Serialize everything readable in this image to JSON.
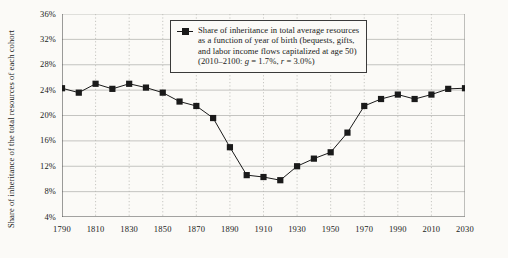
{
  "chart_data": {
    "type": "line",
    "title": "",
    "xlabel": "",
    "ylabel": "Share of inheritance of the total resources of each cohort",
    "xlim": [
      1790,
      2030
    ],
    "ylim": [
      4,
      36
    ],
    "ytick_labels": [
      "36%",
      "32%",
      "28%",
      "24%",
      "20%",
      "16%",
      "12%",
      "8%",
      "4%"
    ],
    "ytick_values": [
      36,
      32,
      28,
      24,
      20,
      16,
      12,
      8,
      4
    ],
    "xtick_labels": [
      "1790",
      "1810",
      "1830",
      "1850",
      "1870",
      "1890",
      "1910",
      "1930",
      "1950",
      "1970",
      "1990",
      "2010",
      "2030"
    ],
    "xtick_values": [
      1790,
      1810,
      1830,
      1850,
      1870,
      1890,
      1910,
      1930,
      1950,
      1970,
      1990,
      2010,
      2030
    ],
    "grid": "horizontal-solid-and-vertical-dotted",
    "legend_position": "top-center",
    "series": [
      {
        "name": "Share of inheritance in total average resources as a function of year of birth",
        "marker": "filled-square",
        "color": "#1a1a1a",
        "x": [
          1790,
          1800,
          1810,
          1820,
          1830,
          1840,
          1850,
          1860,
          1870,
          1880,
          1890,
          1900,
          1910,
          1920,
          1930,
          1940,
          1950,
          1960,
          1970,
          1980,
          1990,
          2000,
          2010,
          2020,
          2030
        ],
        "values": [
          24.3,
          23.6,
          25.0,
          24.2,
          25.0,
          24.4,
          23.6,
          22.2,
          21.5,
          19.6,
          15.0,
          10.6,
          10.3,
          9.8,
          12.0,
          13.2,
          14.2,
          17.3,
          21.5,
          22.6,
          23.3,
          22.6,
          23.3,
          24.2,
          24.3
        ]
      }
    ],
    "legend": {
      "line1": "Share of inheritance in total average resources",
      "line2": "as a function of year of birth (bequests, gifts,",
      "line3": "and labor income flows capitalized at age 50)",
      "line4_prefix": "(2010–2100: ",
      "line4_g": "g",
      "line4_mid": " = 1.7%, ",
      "line4_r": "r",
      "line4_suffix": " = 3.0%)"
    }
  }
}
